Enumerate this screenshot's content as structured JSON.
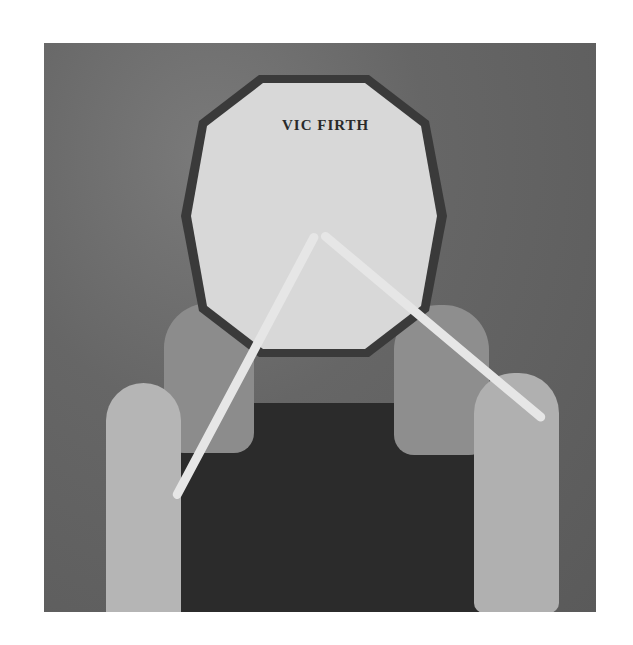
{
  "photo": {
    "subject": "Top-down view of a person playing a practice pad with drumsticks",
    "pad_brand_text": "VIC FIRTH",
    "colors": {
      "background": "#ffffff",
      "floor": "#666666",
      "pad_face": "#d8d8d8",
      "pad_rim": "#3a3a3a",
      "clothing": "#2b2b2b"
    }
  }
}
